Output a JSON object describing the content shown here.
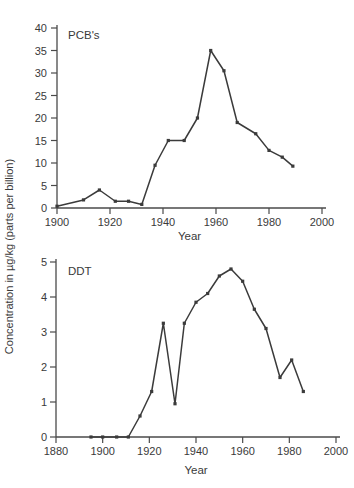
{
  "figure": {
    "ylabel": "Concentration in µg/kg (parts per billion)",
    "line_color": "#3b3b3b",
    "axis_color": "#4a4a4a",
    "text_color": "#3a3a3a",
    "background": "#ffffff"
  },
  "chart_data": [
    {
      "type": "line",
      "title": "PCB's",
      "xlabel": "Year",
      "ylabel": "Concentration in µg/kg (parts per billion)",
      "xlim": [
        1900,
        2000
      ],
      "ylim": [
        0,
        40
      ],
      "x_ticks": [
        1900,
        1920,
        1940,
        1960,
        1980,
        2000
      ],
      "y_ticks": [
        0,
        5,
        10,
        15,
        20,
        25,
        30,
        35,
        40
      ],
      "grid": false,
      "legend": "none",
      "marker": "square",
      "series": [
        {
          "name": "PCB's",
          "x": [
            1900,
            1910,
            1916,
            1922,
            1927,
            1932,
            1937,
            1942,
            1948,
            1953,
            1958,
            1963,
            1968,
            1975,
            1980,
            1985,
            1989
          ],
          "y": [
            0.4,
            1.8,
            4.0,
            1.5,
            1.5,
            0.8,
            9.5,
            15,
            15,
            20,
            35,
            30.5,
            19,
            16.5,
            12.8,
            11.3,
            9.3
          ]
        }
      ]
    },
    {
      "type": "line",
      "title": "DDT",
      "xlabel": "Year",
      "ylabel": "Concentration in µg/kg (parts per billion)",
      "xlim": [
        1880,
        2000
      ],
      "ylim": [
        0,
        5
      ],
      "x_ticks": [
        1880,
        1900,
        1920,
        1940,
        1960,
        1980,
        2000
      ],
      "y_ticks": [
        0,
        1,
        2,
        3,
        4,
        5
      ],
      "grid": false,
      "legend": "none",
      "marker": "square",
      "series": [
        {
          "name": "DDT",
          "x": [
            1895,
            1900,
            1906,
            1911,
            1916,
            1921,
            1926,
            1931,
            1935,
            1940,
            1945,
            1950,
            1955,
            1960,
            1965,
            1970,
            1976,
            1981,
            1986
          ],
          "y": [
            0,
            0,
            0,
            0,
            0.6,
            1.3,
            3.25,
            0.95,
            3.25,
            3.85,
            4.1,
            4.6,
            4.8,
            4.45,
            3.65,
            3.1,
            1.7,
            2.2,
            1.3
          ]
        }
      ]
    }
  ]
}
